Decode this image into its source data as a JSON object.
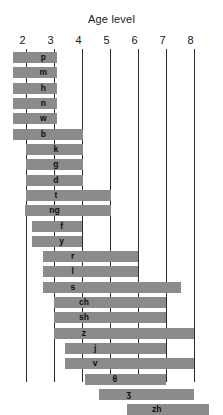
{
  "chart_data": {
    "type": "bar",
    "orientation": "horizontal",
    "title": "Age level",
    "xlabel": "Age level",
    "ylabel": "",
    "xlim": [
      1.55,
      8.55
    ],
    "grid": true,
    "legend": null,
    "tick_labels": [
      "2",
      "3",
      "4",
      "5",
      "6",
      "7",
      "8"
    ],
    "ticks": [
      2,
      3,
      4,
      5,
      6,
      7,
      8
    ],
    "categories": [
      "p",
      "m",
      "h",
      "n",
      "w",
      "b",
      "k",
      "g",
      "d",
      "t",
      "ng",
      "f",
      "y",
      "r",
      "l",
      "s",
      "ch",
      "sh",
      "z",
      "j",
      "v",
      "θ",
      "ʒ",
      "zh"
    ],
    "series": [
      {
        "name": "Age range of sound acquisition",
        "bars": [
          {
            "label": "p",
            "start": 1.55,
            "end": 3.1
          },
          {
            "label": "m",
            "start": 1.55,
            "end": 3.1
          },
          {
            "label": "h",
            "start": 1.55,
            "end": 3.1
          },
          {
            "label": "n",
            "start": 1.55,
            "end": 3.1
          },
          {
            "label": "w",
            "start": 1.55,
            "end": 3.1
          },
          {
            "label": "b",
            "start": 1.55,
            "end": 4.05
          },
          {
            "label": "k",
            "start": 2.0,
            "end": 4.05
          },
          {
            "label": "g",
            "start": 2.0,
            "end": 4.05
          },
          {
            "label": "d",
            "start": 2.0,
            "end": 4.05
          },
          {
            "label": "t",
            "start": 2.0,
            "end": 5.05
          },
          {
            "label": "ng",
            "start": 1.95,
            "end": 5.05
          },
          {
            "label": "f",
            "start": 2.2,
            "end": 4.0
          },
          {
            "label": "y",
            "start": 2.2,
            "end": 4.0
          },
          {
            "label": "r",
            "start": 2.6,
            "end": 6.0
          },
          {
            "label": "l",
            "start": 2.6,
            "end": 6.0
          },
          {
            "label": "s",
            "start": 2.6,
            "end": 7.55
          },
          {
            "label": "ch",
            "start": 3.0,
            "end": 7.0
          },
          {
            "label": "sh",
            "start": 3.0,
            "end": 7.0
          },
          {
            "label": "z",
            "start": 3.0,
            "end": 8.0
          },
          {
            "label": "j",
            "start": 3.4,
            "end": 7.0
          },
          {
            "label": "v",
            "start": 3.4,
            "end": 8.0
          },
          {
            "label": "θ",
            "start": 4.1,
            "end": 7.0
          },
          {
            "label": "ʒ",
            "start": 4.6,
            "end": 8.0
          },
          {
            "label": "zh",
            "start": 5.6,
            "end": 8.55
          }
        ]
      }
    ],
    "colors": {
      "bar": "#8b8b8b",
      "gridline": "#2b2b2b",
      "text": "#0d0d0d",
      "background": "#ffffff"
    }
  }
}
